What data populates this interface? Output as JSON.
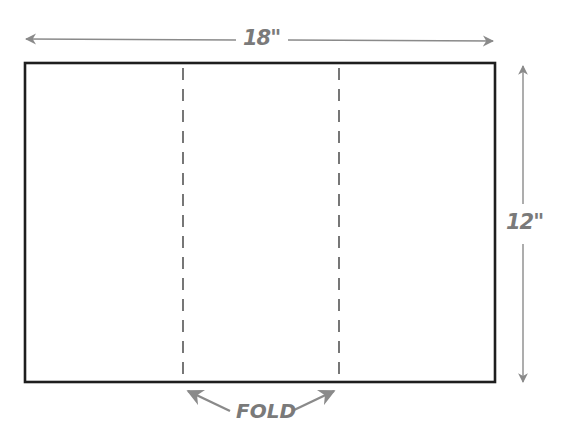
{
  "diagram": {
    "width_label": "18\"",
    "height_label": "12\"",
    "fold_label": "FOLD",
    "panels": 3,
    "fold_lines": 2,
    "colors": {
      "outline": "#1e1e1e",
      "dashes": "#555555",
      "annotation": "#7a7a7a",
      "background": "#ffffff"
    }
  }
}
